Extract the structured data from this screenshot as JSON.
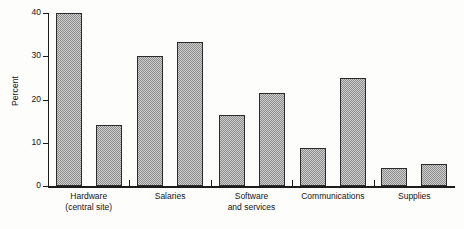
{
  "chart_data": {
    "type": "bar",
    "title": "",
    "subtitle": "",
    "xlabel": "",
    "ylabel": "Percent",
    "ylim": [
      0,
      40
    ],
    "yticks": [
      0,
      10,
      20,
      30,
      40
    ],
    "ytick_labels": [
      "0",
      "10",
      "20",
      "30",
      "40"
    ],
    "grid": false,
    "legend": "none",
    "categories": [
      "Hardware\n(central site)",
      "Salaries",
      "Software\nand services",
      "Communications",
      "Supplies"
    ],
    "series": [
      {
        "name": "Series 1",
        "values": [
          40.0,
          30.0,
          16.5,
          8.8,
          4.2
        ]
      },
      {
        "name": "Series 2",
        "values": [
          14.2,
          33.3,
          21.4,
          25.0,
          5.0
        ]
      }
    ],
    "bar_fill": "#cdcdcd",
    "bar_hatch": "fine checkerboard dither",
    "bar_edge_color": "#2b2b2b",
    "axis_color": "#1c1c1c",
    "background": "#fdfdfc"
  },
  "axis": {
    "y_title": "Percent"
  }
}
